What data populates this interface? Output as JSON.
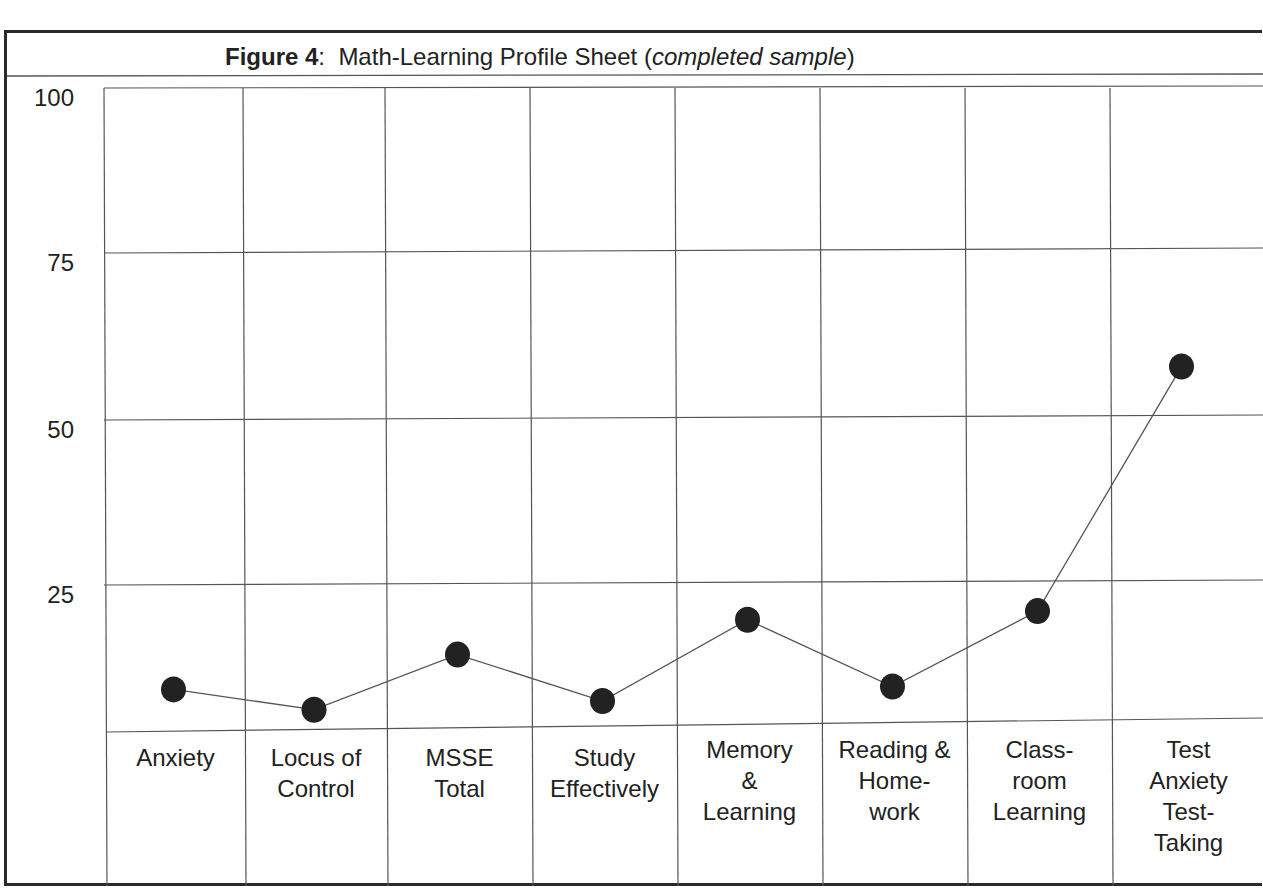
{
  "figure": {
    "title_bold": "Figure 4",
    "title_sep": ":  ",
    "title_main": "Math-Learning Profile Sheet (",
    "title_italic": "completed sample",
    "title_end": ")"
  },
  "colors": {
    "grid": "#555555",
    "frame": "#2a2a2a",
    "marker": "#222222",
    "line": "#555555"
  },
  "chart_data": {
    "type": "line",
    "title": "Figure 4: Math-Learning Profile Sheet (completed sample)",
    "xlabel": "",
    "ylabel": "",
    "ylim": [
      0,
      100
    ],
    "yticks": [
      25,
      50,
      75,
      100
    ],
    "grid": true,
    "legend": null,
    "categories": [
      "Anxiety",
      "Locus of Control",
      "MSSE Total",
      "Study Effectively",
      "Memory & Learning",
      "Reading & Homework",
      "Classroom Learning",
      "Test Anxiety Test-Taking"
    ],
    "category_display": [
      "Anxiety",
      "Locus of\nControl",
      "MSSE\nTotal",
      "Study\nEffectively",
      "Memory\n&\nLearning",
      "Reading &\nHome-\nwork",
      "Class-\nroom\nLearning",
      "Test\nAnxiety\nTest-\nTaking"
    ],
    "series": [
      {
        "name": "Profile",
        "values": [
          7,
          3.5,
          13,
          5,
          19,
          7.5,
          20.5,
          58
        ]
      }
    ]
  }
}
